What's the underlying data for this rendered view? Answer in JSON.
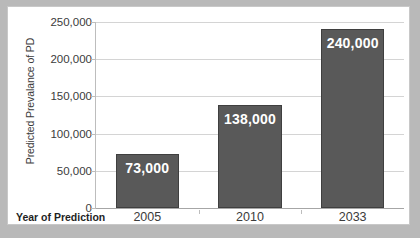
{
  "chart_data": {
    "type": "bar",
    "title": "",
    "xlabel": "Year of Prediction",
    "ylabel": "Predicted  Prevalance of PD",
    "categories": [
      "2005",
      "2010",
      "2033"
    ],
    "values": [
      73000,
      138000,
      240000
    ],
    "data_labels": [
      "73,000",
      "138,000",
      "240,000"
    ],
    "ylim": [
      0,
      250000
    ],
    "yticks": [
      0,
      50000,
      100000,
      150000,
      200000,
      250000
    ],
    "ytick_labels": [
      "0",
      "50,000",
      "100,000",
      "150,000",
      "200,000",
      "250,000"
    ],
    "grid": true,
    "legend": false,
    "series": [
      {
        "name": "Predicted Prevalance of PD",
        "values": [
          73000,
          138000,
          240000
        ]
      }
    ],
    "colors": {
      "bar_fill": "#595959",
      "bar_border": "#3f3f3f",
      "data_label_text": "#ffffff",
      "gridline": "#d4d4d4",
      "axis_line": "#bdbdbd",
      "plot_background": "#ffffff",
      "page_background": "#b9b9b9",
      "frame_border": "#c8c8c8",
      "tick_text": "#3b3b3b",
      "axis_title_text": "#1f1f1f"
    }
  }
}
